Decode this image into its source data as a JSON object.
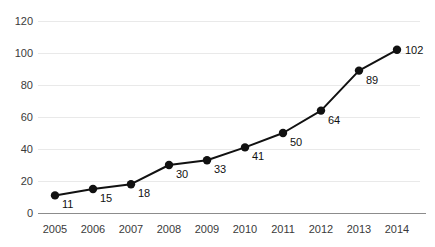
{
  "chart_data": {
    "type": "line",
    "title": "",
    "subtitle": "",
    "xlabel": "",
    "ylabel": "",
    "categories": [
      "2005",
      "2006",
      "2007",
      "2008",
      "2009",
      "2010",
      "2011",
      "2012",
      "2013",
      "2014"
    ],
    "values": [
      11,
      15,
      18,
      30,
      33,
      41,
      50,
      64,
      89,
      102
    ],
    "point_labels": [
      "11",
      "15",
      "18",
      "30",
      "33",
      "41",
      "50",
      "64",
      "89",
      "102"
    ],
    "series": [
      {
        "name": "",
        "values": [
          11,
          15,
          18,
          30,
          33,
          41,
          50,
          64,
          89,
          102
        ]
      }
    ],
    "ylim": [
      0,
      120
    ],
    "yticks": [
      0,
      20,
      40,
      60,
      80,
      100,
      120
    ],
    "ytick_labels": [
      "0",
      "20",
      "40",
      "60",
      "80",
      "100",
      "120"
    ],
    "xtick_labels": [
      "2005",
      "2006",
      "2007",
      "2008",
      "2009",
      "2010",
      "2011",
      "2012",
      "2013",
      "2014"
    ],
    "grid": true,
    "grid_axis": "y",
    "legend": false,
    "legend_position": "none",
    "annotations": [],
    "colors": {
      "line": "#111111",
      "marker": "#111111",
      "grid": "#e9e9e9",
      "axis": "#8c8c8c",
      "tick_text": "#3a3a3a",
      "label_text": "#111111",
      "background": "#ffffff"
    }
  }
}
